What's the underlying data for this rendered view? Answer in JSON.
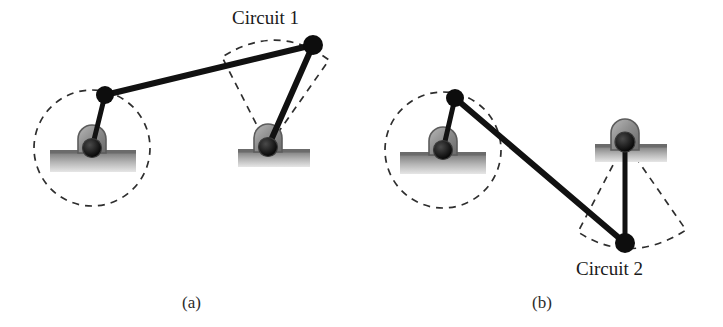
{
  "figure": {
    "title_text_present": false,
    "background_color": "#ffffff",
    "line_color": "#111111",
    "dash_color": "#2e2e2e",
    "ground_color": "#8d8d8d",
    "bearing_color": "#9a9a9a",
    "panels": [
      {
        "id": "panel-a",
        "caption": "(a)",
        "caption_x": 182,
        "caption_y": 308,
        "circuit_label": "Circuit 1",
        "circuit_label_x": 232,
        "circuit_label_y": 24,
        "crank_circle": {
          "cx": 92,
          "cy": 148,
          "r": 58
        },
        "rocker_fan": {
          "apex_x": 268,
          "apex_y": 147,
          "arc_start_x": 222,
          "arc_start_y": 57,
          "arc_ctrl_x": 278,
          "arc_ctrl_y": 22,
          "arc_end_x": 329,
          "arc_end_y": 60
        },
        "ground_pivots": [
          {
            "name": "left-ground-pivot",
            "x": 92,
            "y": 148
          },
          {
            "name": "right-ground-pivot",
            "x": 268,
            "y": 147
          }
        ],
        "ground_bars": [
          {
            "name": "left-ground-bar",
            "x": 50,
            "y": 150,
            "w": 86,
            "h": 22
          },
          {
            "name": "right-ground-bar",
            "x": 238,
            "y": 149,
            "w": 72,
            "h": 18
          }
        ],
        "moving_joints": [
          {
            "name": "crank-pin-joint",
            "x": 105,
            "y": 95,
            "r": 9
          },
          {
            "name": "coupler-rocker-joint",
            "x": 313,
            "y": 45,
            "r": 10
          }
        ],
        "links": [
          {
            "name": "crank-link",
            "x1": 92,
            "y1": 148,
            "x2": 105,
            "y2": 95,
            "w": 5
          },
          {
            "name": "coupler-link",
            "x1": 105,
            "y1": 95,
            "x2": 313,
            "y2": 45,
            "w": 6
          },
          {
            "name": "rocker-link",
            "x1": 313,
            "y1": 45,
            "x2": 268,
            "y2": 147,
            "w": 6
          }
        ]
      },
      {
        "id": "panel-b",
        "caption": "(b)",
        "caption_x": 532,
        "caption_y": 308,
        "circuit_label": "Circuit 2",
        "circuit_label_x": 576,
        "circuit_label_y": 275,
        "crank_circle": {
          "cx": 443,
          "cy": 150,
          "r": 58
        },
        "rocker_fan": {
          "apex_x": 625,
          "apex_y": 142,
          "arc_start_x": 578,
          "arc_start_y": 232,
          "arc_ctrl_x": 630,
          "arc_ctrl_y": 266,
          "arc_end_x": 686,
          "arc_end_y": 230
        },
        "ground_pivots": [
          {
            "name": "left-ground-pivot",
            "x": 443,
            "y": 150
          },
          {
            "name": "right-ground-pivot",
            "x": 625,
            "y": 142
          }
        ],
        "ground_bars": [
          {
            "name": "left-ground-bar",
            "x": 400,
            "y": 152,
            "w": 86,
            "h": 22
          },
          {
            "name": "right-ground-bar",
            "x": 595,
            "y": 144,
            "w": 72,
            "h": 18
          }
        ],
        "moving_joints": [
          {
            "name": "crank-pin-joint",
            "x": 455,
            "y": 98,
            "r": 9
          },
          {
            "name": "coupler-rocker-joint",
            "x": 625,
            "y": 243,
            "r": 10
          }
        ],
        "links": [
          {
            "name": "crank-link",
            "x1": 443,
            "y1": 150,
            "x2": 455,
            "y2": 98,
            "w": 5
          },
          {
            "name": "coupler-link",
            "x1": 455,
            "y1": 98,
            "x2": 625,
            "y2": 243,
            "w": 6
          },
          {
            "name": "rocker-link",
            "x1": 625,
            "y1": 243,
            "x2": 625,
            "y2": 142,
            "w": 5
          }
        ]
      }
    ]
  }
}
